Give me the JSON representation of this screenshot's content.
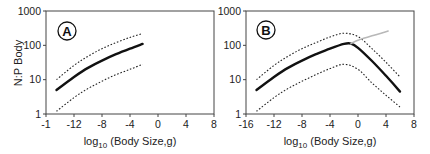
{
  "chart_data": [
    {
      "type": "line",
      "panel": "A",
      "title": "",
      "panel_label": "A",
      "xlabel": "log10 (Body Size,g)",
      "xlabel_parts": {
        "prefix": "log",
        "subscript": "10",
        "suffix": " (Body Size,g)"
      },
      "ylabel": "N:P Body",
      "yscale": "log",
      "ylim": [
        1,
        1000
      ],
      "xlim": [
        -16,
        8
      ],
      "x_tick_labels": [
        "-1",
        "-12",
        "-8",
        "-4",
        "0",
        "4",
        "8"
      ],
      "x_ticks": [
        -16,
        -12,
        -8,
        -4,
        0,
        4,
        8
      ],
      "y_tick_labels": [
        "1",
        "10",
        "100",
        "1000"
      ],
      "y_ticks": [
        1,
        10,
        100,
        1000
      ],
      "grid": false,
      "series": [
        {
          "name": "fit",
          "style": "solid-thick",
          "color": "#111111",
          "x": [
            -14.5,
            -12,
            -10,
            -8,
            -6,
            -4,
            -2.2
          ],
          "y": [
            5,
            12,
            22,
            36,
            55,
            80,
            110
          ]
        },
        {
          "name": "upper bound",
          "style": "dotted",
          "color": "#222222",
          "x": [
            -14.5,
            -12,
            -10,
            -8,
            -6,
            -4,
            -2.2
          ],
          "y": [
            10,
            26,
            48,
            80,
            120,
            170,
            220
          ]
        },
        {
          "name": "lower bound",
          "style": "dotted",
          "color": "#222222",
          "x": [
            -14.5,
            -12,
            -10,
            -8,
            -6,
            -4,
            -2.2
          ],
          "y": [
            1.2,
            3,
            5.5,
            9,
            14,
            20,
            28
          ]
        }
      ]
    },
    {
      "type": "line",
      "panel": "B",
      "title": "",
      "panel_label": "B",
      "xlabel": "log10 (Body Size,g)",
      "xlabel_parts": {
        "prefix": "log",
        "subscript": "10",
        "suffix": " (Body Size,g)"
      },
      "ylabel": "",
      "yscale": "log",
      "ylim": [
        1,
        1000
      ],
      "xlim": [
        -16,
        8
      ],
      "x_tick_labels": [
        "-16",
        "-12",
        "-8",
        "-4",
        "0",
        "4",
        "8"
      ],
      "x_ticks": [
        -16,
        -12,
        -8,
        -4,
        0,
        4,
        8
      ],
      "y_tick_labels": [
        "1",
        "10",
        "100",
        "1000"
      ],
      "y_ticks": [
        1,
        10,
        100,
        1000
      ],
      "grid": false,
      "series": [
        {
          "name": "fit",
          "style": "solid-thick",
          "color": "#111111",
          "x": [
            -14.5,
            -12,
            -10,
            -8,
            -6,
            -4,
            -2,
            -1,
            0,
            2,
            4,
            6
          ],
          "y": [
            5,
            12,
            22,
            36,
            55,
            80,
            110,
            112,
            85,
            35,
            13,
            4.5
          ]
        },
        {
          "name": "upper bound",
          "style": "dotted",
          "color": "#222222",
          "x": [
            -14.5,
            -12,
            -10,
            -8,
            -6,
            -4,
            -2,
            0,
            2,
            4,
            6
          ],
          "y": [
            10,
            26,
            48,
            80,
            120,
            175,
            225,
            180,
            80,
            32,
            12
          ]
        },
        {
          "name": "lower bound",
          "style": "dotted",
          "color": "#222222",
          "x": [
            -14.5,
            -12,
            -10,
            -8,
            -6,
            -4,
            -2,
            0,
            2,
            4,
            6
          ],
          "y": [
            1.2,
            3,
            5.5,
            9,
            14,
            21,
            28,
            20,
            8,
            3.5,
            1.6
          ]
        },
        {
          "name": "extrapolation",
          "style": "solid-thin",
          "color": "#b8b8b8",
          "x": [
            -1,
            0,
            2,
            4.3
          ],
          "y": [
            112,
            140,
            190,
            260
          ]
        }
      ]
    }
  ],
  "panels": {
    "a": {
      "letter": "A"
    },
    "b": {
      "letter": "B"
    }
  },
  "axis": {
    "ylabel": "N:P Body",
    "xlabel_prefix": "log",
    "xlabel_sub": "10",
    "xlabel_suffix": " (Body Size,g)"
  }
}
